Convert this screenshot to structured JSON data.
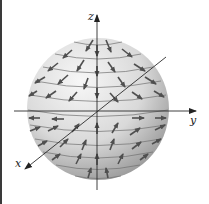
{
  "figure": {
    "axes": {
      "x": {
        "label": "x"
      },
      "y": {
        "label": "y"
      },
      "z": {
        "label": "z"
      }
    },
    "colors": {
      "sphere_light": "#f2f2f2",
      "sphere_dark": "#9a9a9a",
      "arrow": "#555555",
      "axis": "#333333",
      "latitude_line": "#6e6e6e"
    },
    "sphere": {
      "cx": 98,
      "cy": 109,
      "r": 71
    },
    "latitude_count": 11
  }
}
